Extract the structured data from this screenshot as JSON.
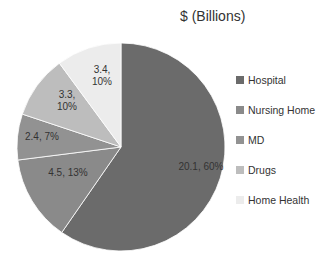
{
  "chart_data": {
    "type": "pie",
    "title": "$ (Billions)",
    "categories": [
      "Hospital",
      "Nursing Home",
      "MD",
      "Drugs",
      "Home Health"
    ],
    "values": [
      20.1,
      4.5,
      2.4,
      3.3,
      3.4
    ],
    "percentages": [
      60,
      13,
      7,
      10,
      10
    ],
    "data_labels": [
      "20.1, 60%",
      "4.5, 13%",
      "2.4, 7%",
      "3.3, 10%",
      "3.4, 10%"
    ],
    "colors": [
      "#6b6b6b",
      "#8a8a8a",
      "#929292",
      "#bdbdbd",
      "#ececec"
    ],
    "start_angle": "12 o'clock",
    "direction": "clockwise",
    "legend_position": "right"
  },
  "legend": {
    "items": [
      {
        "label": "Hospital",
        "color": "#6b6b6b"
      },
      {
        "label": "Nursing Home",
        "color": "#8a8a8a"
      },
      {
        "label": "MD",
        "color": "#929292"
      },
      {
        "label": "Drugs",
        "color": "#bdbdbd"
      },
      {
        "label": "Home Health",
        "color": "#ececec"
      }
    ]
  }
}
